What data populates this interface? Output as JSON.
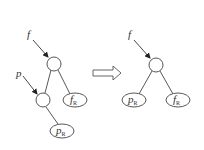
{
  "diagram": {
    "before": {
      "pointers": [
        {
          "label": "f"
        },
        {
          "label": "p"
        }
      ],
      "leaves": [
        {
          "label": "f",
          "subscript": "R"
        },
        {
          "label": "p",
          "subscript": "R"
        }
      ]
    },
    "after": {
      "pointers": [
        {
          "label": "f"
        }
      ],
      "leaves": [
        {
          "label": "p",
          "subscript": "R"
        },
        {
          "label": "f",
          "subscript": "R"
        }
      ]
    },
    "transition": "hollow-right-arrow"
  }
}
